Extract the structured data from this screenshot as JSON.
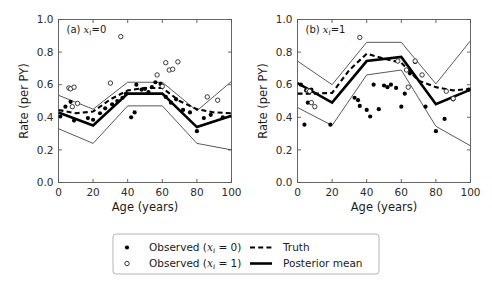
{
  "figure": {
    "background": "#ffffff",
    "width": 492,
    "height": 286
  },
  "axis": {
    "xlabel": "Age (years)",
    "ylabel": "Rate (per PY)",
    "xticks": [
      "0",
      "20",
      "40",
      "60",
      "80",
      "100"
    ],
    "yticks": [
      "0.0",
      "0.2",
      "0.4",
      "0.6",
      "0.8",
      "1.0"
    ]
  },
  "panels": [
    {
      "id": "a",
      "label_prefix": "(a)",
      "label_var": "x",
      "label_sub": "i",
      "label_eq": "=0"
    },
    {
      "id": "b",
      "label_prefix": "(b)",
      "label_var": "x",
      "label_sub": "i",
      "label_eq": "=1"
    }
  ],
  "legend": {
    "entries": [
      {
        "marker": "filled-circle",
        "text_pre": "Observed (",
        "var": "x",
        "sub": "i",
        "text_post": " = 0)"
      },
      {
        "marker": "open-circle",
        "text_pre": "Observed (",
        "var": "x",
        "sub": "i",
        "text_post": " = 1)"
      },
      {
        "marker": "dashed-line",
        "text_pre": "Truth",
        "var": "",
        "sub": "",
        "text_post": ""
      },
      {
        "marker": "solid-line",
        "text_pre": "Posterior mean",
        "var": "",
        "sub": "",
        "text_post": ""
      }
    ]
  },
  "chart_data": {
    "type": "line",
    "title": "",
    "xlabel": "Age (years)",
    "ylabel": "Rate (per PY)",
    "xlim": [
      0,
      100
    ],
    "ylim": [
      0.0,
      1.0
    ],
    "xticks": [
      0,
      20,
      40,
      60,
      80,
      100
    ],
    "yticks": [
      0.0,
      0.2,
      0.4,
      0.6,
      0.8,
      1.0
    ],
    "grid": false,
    "legend_position": "below-figure",
    "panels": [
      {
        "name": "(a) x_i = 0",
        "series": [
          {
            "name": "Truth",
            "style": "dashed",
            "x": [
              0,
              10,
              20,
              30,
              40,
              50,
              60,
              70,
              80,
              90,
              100
            ],
            "y": [
              0.445,
              0.425,
              0.435,
              0.51,
              0.565,
              0.58,
              0.58,
              0.5,
              0.45,
              0.43,
              0.425
            ]
          },
          {
            "name": "Posterior mean",
            "style": "solid-thick",
            "x": [
              0,
              20,
              40,
              60,
              80,
              100
            ],
            "y": [
              0.43,
              0.35,
              0.545,
              0.545,
              0.34,
              0.41
            ]
          },
          {
            "name": "Upper credible bound",
            "style": "solid-thin",
            "x": [
              0,
              20,
              40,
              60,
              80,
              100
            ],
            "y": [
              0.535,
              0.45,
              0.615,
              0.615,
              0.44,
              0.62
            ]
          },
          {
            "name": "Lower credible bound",
            "style": "solid-thin",
            "x": [
              0,
              20,
              40,
              60,
              80,
              100
            ],
            "y": [
              0.33,
              0.24,
              0.47,
              0.47,
              0.24,
              0.2
            ]
          },
          {
            "name": "Observed (x_i = 0)",
            "style": "filled-circle",
            "points": [
              [
                1,
                0.405
              ],
              [
                4,
                0.465
              ],
              [
                7,
                0.495
              ],
              [
                9,
                0.38
              ],
              [
                17,
                0.395
              ],
              [
                20,
                0.385
              ],
              [
                24,
                0.425
              ],
              [
                27,
                0.455
              ],
              [
                31,
                0.48
              ],
              [
                34,
                0.5
              ],
              [
                37,
                0.52
              ],
              [
                39,
                0.545
              ],
              [
                42,
                0.4
              ],
              [
                44,
                0.43
              ],
              [
                45,
                0.6
              ],
              [
                48,
                0.57
              ],
              [
                50,
                0.575
              ],
              [
                52,
                0.555
              ],
              [
                54,
                0.585
              ],
              [
                56,
                0.615
              ],
              [
                59,
                0.605
              ],
              [
                62,
                0.525
              ],
              [
                65,
                0.49
              ],
              [
                68,
                0.51
              ],
              [
                72,
                0.445
              ],
              [
                76,
                0.43
              ],
              [
                80,
                0.315
              ],
              [
                84,
                0.395
              ],
              [
                88,
                0.415
              ],
              [
                95,
                0.4
              ]
            ]
          },
          {
            "name": "Observed (x_i = 1)",
            "style": "open-circle",
            "points": [
              [
                6,
                0.58
              ],
              [
                7,
                0.575
              ],
              [
                9,
                0.585
              ],
              [
                8,
                0.465
              ],
              [
                11,
                0.485
              ],
              [
                30,
                0.61
              ],
              [
                36,
                0.895
              ],
              [
                57,
                0.66
              ],
              [
                60,
                0.59
              ],
              [
                62,
                0.735
              ],
              [
                64,
                0.69
              ],
              [
                66,
                0.695
              ],
              [
                69,
                0.74
              ],
              [
                86,
                0.525
              ],
              [
                92,
                0.505
              ]
            ]
          }
        ]
      },
      {
        "name": "(b) x_i = 1",
        "series": [
          {
            "name": "Truth",
            "style": "dashed",
            "x": [
              0,
              10,
              20,
              30,
              40,
              50,
              60,
              70,
              80,
              90,
              100
            ],
            "y": [
              0.545,
              0.545,
              0.55,
              0.69,
              0.79,
              0.76,
              0.735,
              0.625,
              0.585,
              0.565,
              0.575
            ]
          },
          {
            "name": "Posterior mean",
            "style": "solid-thick",
            "x": [
              0,
              20,
              40,
              60,
              80,
              100
            ],
            "y": [
              0.61,
              0.49,
              0.745,
              0.77,
              0.48,
              0.57
            ]
          },
          {
            "name": "Upper credible bound",
            "style": "solid-thin",
            "x": [
              0,
              20,
              40,
              60,
              80,
              100
            ],
            "y": [
              0.745,
              0.6,
              0.86,
              0.86,
              0.605,
              0.87
            ]
          },
          {
            "name": "Lower credible bound",
            "style": "solid-thin",
            "x": [
              0,
              20,
              40,
              60,
              80,
              100
            ],
            "y": [
              0.46,
              0.35,
              0.66,
              0.69,
              0.345,
              0.225
            ]
          },
          {
            "name": "Observed (x_i = 0)",
            "style": "filled-circle",
            "points": [
              [
                2,
                0.6
              ],
              [
                5,
                0.565
              ],
              [
                7,
                0.555
              ],
              [
                8,
                0.57
              ],
              [
                6,
                0.49
              ],
              [
                4,
                0.355
              ],
              [
                19,
                0.355
              ],
              [
                33,
                0.52
              ],
              [
                35,
                0.505
              ],
              [
                36,
                0.47
              ],
              [
                40,
                0.445
              ],
              [
                42,
                0.405
              ],
              [
                44,
                0.6
              ],
              [
                47,
                0.45
              ],
              [
                50,
                0.595
              ],
              [
                52,
                0.585
              ],
              [
                54,
                0.6
              ],
              [
                57,
                0.58
              ],
              [
                60,
                0.465
              ],
              [
                62,
                0.545
              ],
              [
                65,
                0.67
              ],
              [
                68,
                0.74
              ],
              [
                74,
                0.465
              ],
              [
                80,
                0.315
              ],
              [
                85,
                0.39
              ],
              [
                90,
                0.51
              ],
              [
                99,
                0.57
              ]
            ]
          },
          {
            "name": "Observed (x_i = 1)",
            "style": "open-circle",
            "points": [
              [
                6,
                0.565
              ],
              [
                7,
                0.56
              ],
              [
                8,
                0.49
              ],
              [
                10,
                0.465
              ],
              [
                36,
                0.89
              ],
              [
                58,
                0.745
              ],
              [
                63,
                0.69
              ],
              [
                64,
                0.585
              ],
              [
                68,
                0.745
              ],
              [
                72,
                0.66
              ],
              [
                86,
                0.56
              ],
              [
                90,
                0.515
              ]
            ]
          }
        ]
      }
    ]
  }
}
